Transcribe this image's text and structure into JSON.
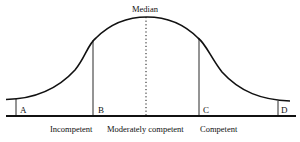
{
  "diagram": {
    "type": "normal-distribution-curve",
    "peak_label": "Median",
    "segment_markers": [
      {
        "id": "A",
        "label": "A",
        "x": 16
      },
      {
        "id": "B",
        "label": "B",
        "x": 93
      },
      {
        "id": "C",
        "label": "C",
        "x": 199
      },
      {
        "id": "D",
        "label": "D",
        "x": 278
      }
    ],
    "categories": [
      {
        "label": "Incompetent"
      },
      {
        "label": "Moderately competent"
      },
      {
        "label": "Competent"
      }
    ],
    "colors": {
      "line": "#111111",
      "background": "#ffffff"
    }
  }
}
